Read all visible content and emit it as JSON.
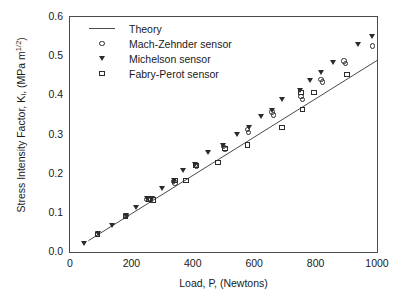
{
  "chart_data": {
    "type": "scatter",
    "title": "",
    "xlabel": "Load, P, (Newtons)",
    "ylabel": "Stress Intensity Factor, K_I, (MPa m^1/2)",
    "ylabel_parts": {
      "prefix": "Stress Intensity Factor, K",
      "subscript": "I",
      "middle": ", (MPa m",
      "superscript": "1/2",
      "suffix": ")"
    },
    "xlim": [
      0,
      1000
    ],
    "ylim": [
      0.0,
      0.6
    ],
    "xticks": [
      0,
      200,
      400,
      600,
      800,
      1000
    ],
    "xtick_labels": [
      "0",
      "200",
      "400",
      "600",
      "800",
      "1000"
    ],
    "yticks": [
      0.0,
      0.1,
      0.2,
      0.3,
      0.4,
      0.5,
      0.6
    ],
    "ytick_labels": [
      "0.0",
      "0.1",
      "0.2",
      "0.3",
      "0.4",
      "0.5",
      "0.6"
    ],
    "x_minor_interval": 100,
    "y_minor_interval": 0.05,
    "grid": false,
    "frame": "box",
    "tick_direction": "in",
    "legend_position": "top-left",
    "legend": [
      {
        "label": "Theory",
        "marker": "line",
        "color": "#4a4a4a"
      },
      {
        "label": "Mach-Zehnder sensor",
        "marker": "circle",
        "color": "#2b2b2b"
      },
      {
        "label": "Michelson sensor",
        "marker": "triangle-down",
        "color": "#2b2b2b"
      },
      {
        "label": "Fabry-Perot sensor",
        "marker": "square",
        "color": "#2b2b2b"
      }
    ],
    "series": [
      {
        "name": "Theory",
        "marker": "line",
        "type": "line",
        "x": [
          60,
          1000
        ],
        "y": [
          0.029,
          0.489
        ]
      },
      {
        "name": "Mach-Zehnder sensor",
        "marker": "circle",
        "type": "scatter",
        "points": [
          [
            90,
            0.046
          ],
          [
            180,
            0.09
          ],
          [
            183,
            0.093
          ],
          [
            250,
            0.134
          ],
          [
            258,
            0.136
          ],
          [
            262,
            0.133
          ],
          [
            338,
            0.18
          ],
          [
            342,
            0.176
          ],
          [
            408,
            0.222
          ],
          [
            412,
            0.218
          ],
          [
            500,
            0.27
          ],
          [
            505,
            0.263
          ],
          [
            578,
            0.312
          ],
          [
            582,
            0.305
          ],
          [
            658,
            0.357
          ],
          [
            662,
            0.35
          ],
          [
            752,
            0.397
          ],
          [
            757,
            0.39
          ],
          [
            818,
            0.44
          ],
          [
            822,
            0.434
          ],
          [
            893,
            0.488
          ],
          [
            897,
            0.482
          ],
          [
            985,
            0.526
          ]
        ]
      },
      {
        "name": "Michelson sensor",
        "marker": "triangle-down",
        "type": "scatter",
        "points": [
          [
            48,
            0.022
          ],
          [
            92,
            0.047
          ],
          [
            138,
            0.068
          ],
          [
            182,
            0.092
          ],
          [
            215,
            0.114
          ],
          [
            252,
            0.136
          ],
          [
            268,
            0.137
          ],
          [
            300,
            0.161
          ],
          [
            340,
            0.183
          ],
          [
            368,
            0.209
          ],
          [
            408,
            0.224
          ],
          [
            450,
            0.254
          ],
          [
            500,
            0.271
          ],
          [
            545,
            0.3
          ],
          [
            585,
            0.318
          ],
          [
            622,
            0.345
          ],
          [
            658,
            0.36
          ],
          [
            692,
            0.39
          ],
          [
            750,
            0.411
          ],
          [
            782,
            0.437
          ],
          [
            818,
            0.459
          ],
          [
            858,
            0.484
          ],
          [
            938,
            0.529
          ],
          [
            985,
            0.551
          ]
        ]
      },
      {
        "name": "Fabry-Perot sensor",
        "marker": "square",
        "type": "scatter",
        "points": [
          [
            90,
            0.045
          ],
          [
            180,
            0.09
          ],
          [
            255,
            0.134
          ],
          [
            272,
            0.133
          ],
          [
            342,
            0.182
          ],
          [
            378,
            0.183
          ],
          [
            410,
            0.221
          ],
          [
            482,
            0.228
          ],
          [
            505,
            0.265
          ],
          [
            578,
            0.273
          ],
          [
            690,
            0.318
          ],
          [
            752,
            0.407
          ],
          [
            758,
            0.364
          ],
          [
            795,
            0.408
          ],
          [
            902,
            0.453
          ]
        ]
      }
    ]
  }
}
